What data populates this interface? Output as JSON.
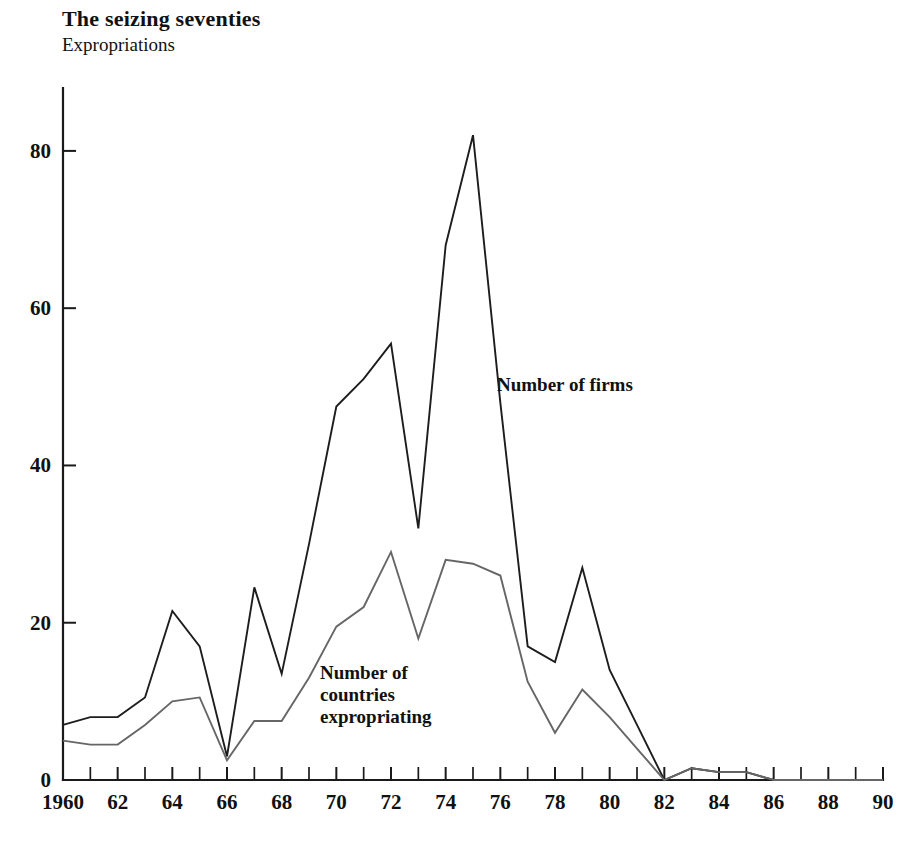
{
  "header": {
    "title": "The seizing seventies",
    "subtitle": "Expropriations"
  },
  "annotations": {
    "firms_label": "Number of firms",
    "countries_label": "Number of\ncountries\nexpropriating"
  },
  "colors": {
    "firms_line": "#1d1d1d",
    "countries_line": "#666666",
    "axis": "#1a1a1a",
    "text": "#111111",
    "background": "#ffffff"
  },
  "axes": {
    "y_ticks": [
      "0",
      "20",
      "40",
      "60",
      "80"
    ],
    "y_tick_values": [
      0,
      20,
      40,
      60,
      80
    ],
    "x_tick_labels": [
      "1960",
      "62",
      "64",
      "66",
      "68",
      "70",
      "72",
      "74",
      "76",
      "78",
      "80",
      "82",
      "84",
      "86",
      "88",
      "90"
    ],
    "x_tick_label_values": [
      1960,
      1962,
      1964,
      1966,
      1968,
      1970,
      1972,
      1974,
      1976,
      1978,
      1980,
      1982,
      1984,
      1986,
      1988,
      1990
    ],
    "x_minor_every": 1,
    "ylim": [
      0,
      88
    ],
    "xlim": [
      1960,
      1990
    ],
    "grid": false
  },
  "chart_data": {
    "type": "line",
    "title": "The seizing seventies",
    "subtitle": "Expropriations",
    "xlabel": "",
    "ylabel": "",
    "xlim": [
      1960,
      1990
    ],
    "ylim": [
      0,
      88
    ],
    "grid": false,
    "legend": "inline-annotations",
    "x": [
      1960,
      1961,
      1962,
      1963,
      1964,
      1965,
      1966,
      1967,
      1968,
      1969,
      1970,
      1971,
      1972,
      1973,
      1974,
      1975,
      1976,
      1977,
      1978,
      1979,
      1980,
      1981,
      1982,
      1983,
      1984,
      1985,
      1986,
      1987,
      1988,
      1989,
      1990
    ],
    "series": [
      {
        "name": "Number of firms",
        "color": "#1d1d1d",
        "values": [
          7,
          8,
          8,
          10.5,
          21.5,
          17,
          3,
          24.5,
          13.5,
          30,
          47.5,
          51,
          55.5,
          32,
          68,
          82,
          48,
          17,
          15,
          27,
          14,
          7,
          0,
          1.5,
          1,
          1,
          0,
          0,
          0,
          0,
          0
        ]
      },
      {
        "name": "Number of countries expropriating",
        "color": "#666666",
        "values": [
          5,
          4.5,
          4.5,
          7,
          10,
          10.5,
          2.5,
          7.5,
          7.5,
          13,
          19.5,
          22,
          29,
          18,
          28,
          27.5,
          26,
          12.5,
          6,
          11.5,
          8,
          4,
          0,
          1.5,
          1,
          1,
          0,
          0,
          0,
          0,
          0
        ]
      }
    ]
  }
}
